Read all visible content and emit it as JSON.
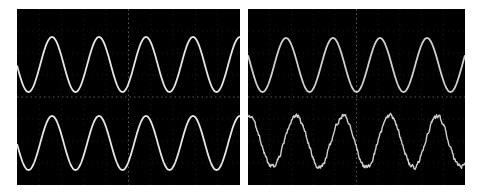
{
  "chart_data": [
    {
      "type": "line",
      "title": "",
      "panel": "left",
      "grid": true,
      "grid_style": "dotted center crosshair",
      "series": [
        {
          "name": "trace-1",
          "waveform": "sine",
          "period_px": 47,
          "peak_y": 37,
          "trough_y": 92,
          "first_peak_x": 52,
          "noise": 0
        },
        {
          "name": "trace-2",
          "waveform": "sine",
          "period_px": 47,
          "peak_y": 116,
          "trough_y": 170,
          "first_peak_x": 52,
          "noise": 0
        }
      ],
      "cycles_visible": 4.8,
      "background": "#000000",
      "trace_color": "#e6e6e6"
    },
    {
      "type": "line",
      "title": "",
      "panel": "right",
      "grid": true,
      "grid_style": "dotted center crosshair",
      "series": [
        {
          "name": "trace-1",
          "waveform": "sine",
          "period_px": 47,
          "peak_y": 38,
          "trough_y": 92,
          "first_peak_x": 286,
          "noise": 0
        },
        {
          "name": "trace-2",
          "waveform": "noisy sine",
          "period_px": 47,
          "peak_y": 116,
          "trough_y": 167,
          "first_peak_x": 296,
          "noise": 2.2
        }
      ],
      "cycles_visible": 4.6,
      "background": "#000000",
      "trace_color": "#d0d0d0"
    }
  ],
  "panels": {
    "left": {
      "x": 17,
      "y": 9,
      "w": 223,
      "h": 176
    },
    "right": {
      "x": 248,
      "y": 9,
      "w": 217,
      "h": 176
    }
  }
}
